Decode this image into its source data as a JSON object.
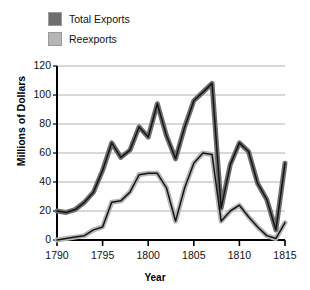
{
  "chart_data": {
    "type": "line",
    "title": "",
    "xlabel": "Year",
    "ylabel": "Millions of Dollars",
    "xlim": [
      1790,
      1815
    ],
    "ylim": [
      0,
      120
    ],
    "yticks": [
      0,
      20,
      40,
      60,
      80,
      100,
      120
    ],
    "xticks": [
      1790,
      1795,
      1800,
      1805,
      1810,
      1815
    ],
    "grid": "horizontal",
    "legend_position": "top-left",
    "x": [
      1790,
      1791,
      1792,
      1793,
      1794,
      1795,
      1796,
      1797,
      1798,
      1799,
      1800,
      1801,
      1802,
      1803,
      1804,
      1805,
      1806,
      1807,
      1808,
      1809,
      1810,
      1811,
      1812,
      1813,
      1814,
      1815
    ],
    "series": [
      {
        "name": "Total Exports",
        "color": "#6e6e6e",
        "values": [
          20,
          19,
          21,
          26,
          33,
          48,
          67,
          57,
          62,
          78,
          71,
          94,
          72,
          56,
          78,
          96,
          102,
          108,
          22,
          52,
          67,
          61,
          39,
          28,
          7,
          53
        ]
      },
      {
        "name": "Reexports",
        "color": "#b5b5b5",
        "values": [
          0,
          1,
          2,
          3,
          7,
          9,
          26,
          27,
          33,
          45,
          46,
          46,
          36,
          13,
          36,
          53,
          60,
          59,
          13,
          20,
          24,
          16,
          9,
          3,
          1,
          12
        ]
      }
    ]
  },
  "legend": {
    "items": [
      {
        "label": "Total Exports",
        "color": "#6e6e6e"
      },
      {
        "label": "Reexports",
        "color": "#b5b5b5"
      }
    ]
  },
  "axes": {
    "y_title": "Millions of Dollars",
    "x_title": "Year",
    "y_tick_labels": [
      "120",
      "100",
      "80",
      "60",
      "40",
      "20",
      "0"
    ],
    "x_tick_labels": [
      "1790",
      "1795",
      "1800",
      "1805",
      "1810",
      "1815"
    ]
  }
}
